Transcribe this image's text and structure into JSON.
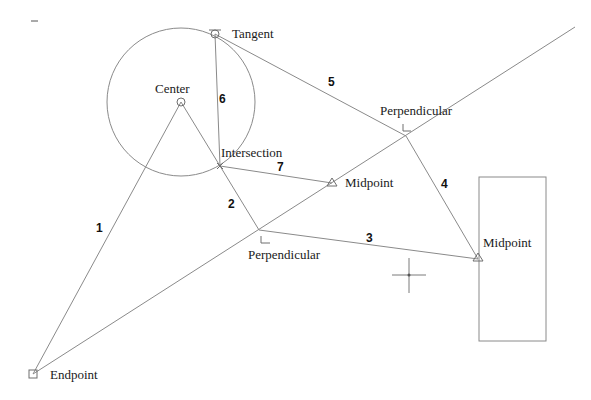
{
  "colors": {
    "background": "#ffffff",
    "geometry": "#8a8a8a",
    "marker": "#6e6e6e",
    "text": "#1a1a1a"
  },
  "snap_points": {
    "tangent": {
      "label": "Tangent",
      "icon": "tangent-snap-icon"
    },
    "center": {
      "label": "Center",
      "icon": "center-snap-icon"
    },
    "intersection": {
      "label": "Intersection",
      "icon": "intersection-snap-icon"
    },
    "perpendicular_upper": {
      "label": "Perpendicular",
      "icon": "perpendicular-snap-icon"
    },
    "midpoint_line": {
      "label": "Midpoint",
      "icon": "midpoint-snap-icon"
    },
    "perpendicular_lower": {
      "label": "Perpendicular",
      "icon": "perpendicular-snap-icon"
    },
    "midpoint_rect": {
      "label": "Midpoint",
      "icon": "midpoint-snap-icon"
    },
    "endpoint": {
      "label": "Endpoint",
      "icon": "endpoint-snap-icon"
    }
  },
  "segments": [
    {
      "id": "1",
      "label": "1",
      "from": "endpoint",
      "to": "center"
    },
    {
      "id": "2",
      "label": "2",
      "from": "center",
      "to": "perpendicular_lower"
    },
    {
      "id": "3",
      "label": "3",
      "from": "perpendicular_lower",
      "to": "midpoint_rect"
    },
    {
      "id": "4",
      "label": "4",
      "from": "midpoint_rect",
      "to": "perpendicular_upper"
    },
    {
      "id": "5",
      "label": "5",
      "from": "perpendicular_upper",
      "to": "tangent"
    },
    {
      "id": "6",
      "label": "6",
      "from": "tangent",
      "to": "intersection"
    },
    {
      "id": "7",
      "label": "7",
      "from": "intersection",
      "to": "midpoint_line"
    }
  ],
  "cursor": {
    "icon": "crosshair-cursor-icon"
  }
}
